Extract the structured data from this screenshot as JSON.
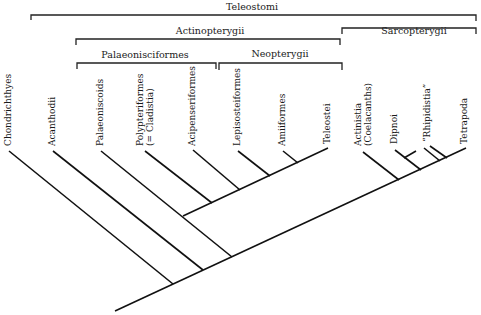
{
  "groups": [
    {
      "id": "teleostomi",
      "label": "Teleostomi"
    },
    {
      "id": "actinopterygii",
      "label": "Actinopterygii"
    },
    {
      "id": "sarcopterygii",
      "label": "Sarcopterygii"
    },
    {
      "id": "palaeonisciformes",
      "label": "Palaeonisciformes"
    },
    {
      "id": "neopterygii",
      "label": "Neopterygii"
    }
  ],
  "taxa": [
    {
      "id": "chondrichthyes",
      "lines": [
        "Chondrichthyes"
      ]
    },
    {
      "id": "acanthodii",
      "lines": [
        "Acanthodii"
      ]
    },
    {
      "id": "palaeoniscoids",
      "lines": [
        "Palaeoniscoids"
      ]
    },
    {
      "id": "polypteriformes",
      "lines": [
        "Polypteriformes",
        "(= Cladistia)"
      ]
    },
    {
      "id": "acipenseriformes",
      "lines": [
        "Acipenseriformes"
      ]
    },
    {
      "id": "lepisosteiformes",
      "lines": [
        "Lepisosteiformes"
      ]
    },
    {
      "id": "amiiformes",
      "lines": [
        "Amiiformes"
      ]
    },
    {
      "id": "teleostei",
      "lines": [
        "Teleostei"
      ]
    },
    {
      "id": "actinistia",
      "lines": [
        "Actinistia",
        "(Coelacanths)"
      ]
    },
    {
      "id": "dipnoi",
      "lines": [
        "Dipnoi"
      ]
    },
    {
      "id": "rhipidistia",
      "lines": [
        "“Rhipidistia”"
      ]
    },
    {
      "id": "tetrapoda",
      "lines": [
        "Tetrapoda"
      ]
    }
  ]
}
